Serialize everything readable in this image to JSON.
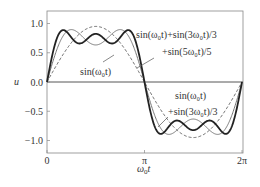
{
  "chart_data": {
    "type": "line",
    "title": "",
    "xlabel": "ω0t",
    "ylabel": "u",
    "xlim": [
      0,
      6.2832
    ],
    "ylim": [
      -1.2,
      1.2
    ],
    "grid": false,
    "x_ticks": [
      {
        "value": 0,
        "label": "0"
      },
      {
        "value": 3.1416,
        "label": "π"
      },
      {
        "value": 6.2832,
        "label": "2π"
      }
    ],
    "y_ticks": [
      {
        "value": 1.0,
        "label": "1.0"
      },
      {
        "value": 0.5,
        "label": "0.5"
      },
      {
        "value": 0.0,
        "label": "0.0"
      },
      {
        "value": -0.5,
        "label": "−0.5"
      },
      {
        "value": -1.0,
        "label": "−1.0"
      }
    ],
    "series": [
      {
        "name": "sin(ω0t)",
        "harmonics": [
          [
            1,
            1
          ]
        ],
        "style": "dashed",
        "color": "#555555",
        "width": 0.9,
        "scale": 0.95
      },
      {
        "name": "sin(ω0t)+sin(3ω0t)/3",
        "harmonics": [
          [
            1,
            1
          ],
          [
            3,
            0.3333
          ]
        ],
        "style": "solid",
        "color": "#777777",
        "width": 1.0,
        "scale": 0.95
      },
      {
        "name": "sin(ω0t)+sin(3ω0t)/3+sin(5ω0t)/5",
        "harmonics": [
          [
            1,
            1
          ],
          [
            3,
            0.3333
          ],
          [
            5,
            0.2
          ]
        ],
        "style": "solid",
        "color": "#222222",
        "width": 1.8,
        "scale": 0.95
      }
    ],
    "annotations": [
      {
        "text": "sin(ω₀t)+sin(3ω₀t)/3",
        "x": 136,
        "y": 38
      },
      {
        "text": "+sin(5ω₀t)/5",
        "x": 162,
        "y": 55
      },
      {
        "text": "sin(ω₀t)",
        "x": 80,
        "y": 75
      },
      {
        "text": "sin(ω₀t)",
        "x": 175,
        "y": 99
      },
      {
        "text": "+sin(3ω₀t)/3",
        "x": 168,
        "y": 115
      }
    ]
  },
  "labels": {
    "ylabel": "u",
    "xlabel_main": "ω",
    "xlabel_sub": "0",
    "xlabel_t": "t"
  }
}
